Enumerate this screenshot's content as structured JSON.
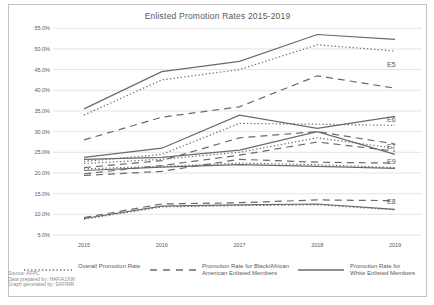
{
  "chart_data": {
    "type": "line",
    "title": "Enlisted Promotion Rates 2015-2019",
    "x_labels": [
      "2015",
      "2016",
      "2017",
      "2018",
      "2019"
    ],
    "ylim": [
      5,
      55
    ],
    "ytick_step": 5,
    "ytick_labels": [
      "5.0%",
      "10.0%",
      "15.0%",
      "20.0%",
      "25.0%",
      "30.0%",
      "35.0%",
      "40.0%",
      "45.0%",
      "50.0%",
      "55.0%"
    ],
    "grid": "horizontal",
    "legend_position": "bottom",
    "series": [
      {
        "name": "E5 Promotion Rate for White Enlisted Members",
        "rank": "E5",
        "group": "white",
        "style": "solid",
        "values": [
          35.5,
          44.5,
          47.0,
          53.5,
          52.3
        ]
      },
      {
        "name": "E5 Overall Promotion Rate",
        "rank": "E5",
        "group": "overall",
        "style": "dotted",
        "values": [
          34.0,
          42.5,
          45.0,
          51.0,
          49.5
        ]
      },
      {
        "name": "E5 Promotion Rate for Black/African American Enlisted Members",
        "rank": "E5",
        "group": "black",
        "style": "dashed",
        "values": [
          28.0,
          33.5,
          36.0,
          43.5,
          40.5
        ]
      },
      {
        "name": "E6 Promotion Rate for White Enlisted Members",
        "rank": "E6",
        "group": "white",
        "style": "solid",
        "values": [
          23.8,
          26.0,
          34.0,
          30.8,
          33.7
        ]
      },
      {
        "name": "E6 Overall Promotion Rate",
        "rank": "E6",
        "group": "overall",
        "style": "dotted",
        "values": [
          22.8,
          24.5,
          32.0,
          31.8,
          31.5
        ]
      },
      {
        "name": "E6 Promotion Rate for Black/African American Enlisted Members",
        "rank": "E6",
        "group": "black",
        "style": "dashed",
        "values": [
          21.3,
          23.0,
          28.5,
          30.0,
          27.0
        ]
      },
      {
        "name": "E7 Promotion Rate for White Enlisted Members",
        "rank": "E7",
        "group": "white",
        "style": "solid",
        "values": [
          23.3,
          23.8,
          25.5,
          30.0,
          24.5
        ]
      },
      {
        "name": "E7 Overall Promotion Rate",
        "rank": "E7",
        "group": "overall",
        "style": "dotted",
        "values": [
          22.3,
          23.3,
          25.0,
          28.5,
          26.0
        ]
      },
      {
        "name": "E7 Promotion Rate for Black/African American Enlisted Members",
        "rank": "E7",
        "group": "black",
        "style": "dashed",
        "values": [
          19.8,
          21.8,
          24.3,
          27.5,
          25.3
        ]
      },
      {
        "name": "E9 Promotion Rate for White Enlisted Members",
        "rank": "E9",
        "group": "white",
        "style": "solid",
        "values": [
          20.6,
          21.4,
          22.0,
          21.6,
          21.1
        ]
      },
      {
        "name": "E9 Overall Promotion Rate",
        "rank": "E9",
        "group": "overall",
        "style": "dotted",
        "values": [
          21.0,
          21.6,
          22.4,
          22.0,
          21.3
        ]
      },
      {
        "name": "E9 Promotion Rate for Black/African American Enlisted Members",
        "rank": "E9",
        "group": "black",
        "style": "dashed",
        "values": [
          19.4,
          20.4,
          23.3,
          22.6,
          22.4
        ]
      },
      {
        "name": "E8 Promotion Rate for White Enlisted Members",
        "rank": "E8",
        "group": "white",
        "style": "solid",
        "values": [
          9.0,
          12.0,
          12.3,
          12.5,
          11.2
        ]
      },
      {
        "name": "E8 Overall Promotion Rate",
        "rank": "E8",
        "group": "overall",
        "style": "dotted",
        "values": [
          8.8,
          11.8,
          12.1,
          12.3,
          11.1
        ]
      },
      {
        "name": "E8 Promotion Rate for Black/African American Enlisted Members",
        "rank": "E8",
        "group": "black",
        "style": "dashed",
        "values": [
          9.2,
          12.5,
          12.8,
          13.5,
          13.3
        ]
      }
    ],
    "rank_labels": [
      {
        "label": "E5",
        "y": 46.3
      },
      {
        "label": "E6",
        "y": 33.0
      },
      {
        "label": "E7",
        "y": 26.5
      },
      {
        "label": "E9",
        "y": 22.8
      },
      {
        "label": "E8",
        "y": 13.2
      }
    ],
    "colors": {
      "line": "#6a6a6a",
      "grid": "#d9d9d9",
      "text": "#595959",
      "footer_text": "#8a8a8a",
      "border": "#c3c3c3"
    }
  },
  "legend": {
    "overall": "Overall Promotion Rate",
    "black": "Promotion Rate for Black/African\nAmerican Enlisted Members",
    "white": "Promotion Rate for\nWhite Enlisted Members"
  },
  "footer": {
    "line1": "Source: AFPC",
    "line2": "Data prepared by: HAF/A1XW",
    "line3": "Graph generated by: SAF/MR"
  }
}
